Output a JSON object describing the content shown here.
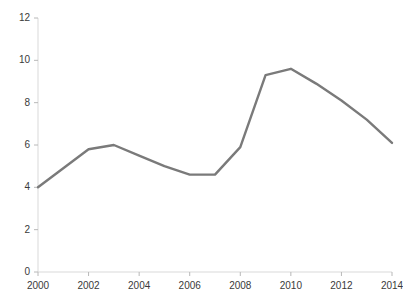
{
  "chart_data": {
    "type": "line",
    "title": "",
    "subtitle": "",
    "xlabel": "",
    "ylabel": "",
    "x": [
      2000,
      2001,
      2002,
      2003,
      2004,
      2005,
      2006,
      2007,
      2008,
      2009,
      2010,
      2011,
      2012,
      2013,
      2014
    ],
    "series": [
      {
        "name": "value",
        "values": [
          4.0,
          4.9,
          5.8,
          6.0,
          5.5,
          5.0,
          4.6,
          4.6,
          5.9,
          9.3,
          9.6,
          8.9,
          8.1,
          7.2,
          6.1
        ],
        "color": "#7a7a7a"
      }
    ],
    "xlim": [
      2000,
      2014
    ],
    "ylim": [
      0,
      12
    ],
    "xticks": [
      2000,
      2002,
      2004,
      2006,
      2008,
      2010,
      2012,
      2014
    ],
    "xtick_labels": [
      "2000",
      "2002",
      "2004",
      "2006",
      "2008",
      "2010",
      "2012",
      "2014"
    ],
    "yticks": [
      0,
      2,
      4,
      6,
      8,
      10,
      12
    ],
    "ytick_labels": [
      "0",
      "2",
      "4",
      "6",
      "8",
      "10",
      "12"
    ],
    "grid": false,
    "legend": false,
    "legend_position": "none"
  },
  "style": {
    "line_color": "#7a7a7a",
    "axis_color": "#d5d5d5",
    "tick_color": "#b8b8b8",
    "label_color": "#3a3a3a",
    "background": "#ffffff",
    "line_width": 2.4
  },
  "caption": {
    "sliver_text": ""
  }
}
